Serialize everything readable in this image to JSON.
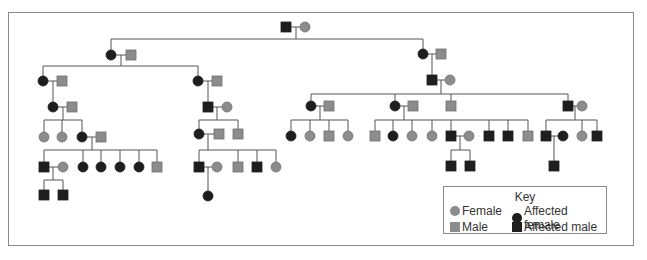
{
  "colors": {
    "unaffected": "#8c8c8c",
    "unaffected_stroke": "#6e6e6e",
    "affected": "#1e1e1e",
    "line": "#555555"
  },
  "key": {
    "title": "Key",
    "items": [
      {
        "label": "Female",
        "shape": "circle",
        "affected": false
      },
      {
        "label": "Affected female",
        "shape": "circle",
        "affected": true
      },
      {
        "label": "Male",
        "shape": "square",
        "affected": false
      },
      {
        "label": "Affected male",
        "shape": "square",
        "affected": true
      }
    ]
  },
  "pedigree": {
    "symbol_size": 10,
    "individuals": [
      {
        "id": "g1m",
        "sex": "M",
        "affected": true,
        "x": 286,
        "y": 27
      },
      {
        "id": "g1f",
        "sex": "F",
        "affected": false,
        "x": 305,
        "y": 27
      },
      {
        "id": "g2Lf",
        "sex": "F",
        "affected": true,
        "x": 111,
        "y": 55
      },
      {
        "id": "g2Lm",
        "sex": "M",
        "affected": false,
        "x": 131,
        "y": 55
      },
      {
        "id": "g2Rf",
        "sex": "F",
        "affected": true,
        "x": 423,
        "y": 54
      },
      {
        "id": "g2Rm",
        "sex": "M",
        "affected": false,
        "x": 441,
        "y": 54
      },
      {
        "id": "g3aF",
        "sex": "F",
        "affected": true,
        "x": 43,
        "y": 81
      },
      {
        "id": "g3aM",
        "sex": "M",
        "affected": false,
        "x": 62,
        "y": 81
      },
      {
        "id": "g3bF",
        "sex": "F",
        "affected": true,
        "x": 198,
        "y": 81
      },
      {
        "id": "g3bM",
        "sex": "M",
        "affected": false,
        "x": 217,
        "y": 81
      },
      {
        "id": "g3cM",
        "sex": "M",
        "affected": true,
        "x": 432,
        "y": 80
      },
      {
        "id": "g3cF",
        "sex": "F",
        "affected": false,
        "x": 450,
        "y": 80
      },
      {
        "id": "g4aF",
        "sex": "F",
        "affected": true,
        "x": 53,
        "y": 107
      },
      {
        "id": "g4aM",
        "sex": "M",
        "affected": false,
        "x": 72,
        "y": 107
      },
      {
        "id": "g4bM",
        "sex": "M",
        "affected": true,
        "x": 208,
        "y": 107
      },
      {
        "id": "g4bF",
        "sex": "F",
        "affected": false,
        "x": 227,
        "y": 107
      },
      {
        "id": "g4cF",
        "sex": "F",
        "affected": true,
        "x": 311,
        "y": 106
      },
      {
        "id": "g4cM",
        "sex": "M",
        "affected": false,
        "x": 329,
        "y": 106
      },
      {
        "id": "g4dF",
        "sex": "F",
        "affected": true,
        "x": 395,
        "y": 106
      },
      {
        "id": "g4dM",
        "sex": "M",
        "affected": false,
        "x": 413,
        "y": 106
      },
      {
        "id": "g4eM",
        "sex": "M",
        "affected": false,
        "x": 451,
        "y": 106
      },
      {
        "id": "g4fM",
        "sex": "M",
        "affected": true,
        "x": 568,
        "y": 106
      },
      {
        "id": "g4fF",
        "sex": "F",
        "affected": false,
        "x": 582,
        "y": 106
      },
      {
        "id": "g5a1",
        "sex": "F",
        "affected": false,
        "x": 44,
        "y": 137
      },
      {
        "id": "g5a2",
        "sex": "F",
        "affected": false,
        "x": 62,
        "y": 137
      },
      {
        "id": "g5a3",
        "sex": "F",
        "affected": true,
        "x": 82,
        "y": 137
      },
      {
        "id": "g5a3m",
        "sex": "M",
        "affected": false,
        "x": 101,
        "y": 137
      },
      {
        "id": "g5b1",
        "sex": "F",
        "affected": true,
        "x": 199,
        "y": 134
      },
      {
        "id": "g5b1m",
        "sex": "M",
        "affected": false,
        "x": 219,
        "y": 134
      },
      {
        "id": "g5b2",
        "sex": "M",
        "affected": false,
        "x": 238,
        "y": 134
      },
      {
        "id": "g5c1",
        "sex": "F",
        "affected": true,
        "x": 291,
        "y": 136
      },
      {
        "id": "g5c2",
        "sex": "F",
        "affected": false,
        "x": 310,
        "y": 136
      },
      {
        "id": "g5c3",
        "sex": "M",
        "affected": false,
        "x": 329,
        "y": 136
      },
      {
        "id": "g5c4",
        "sex": "F",
        "affected": false,
        "x": 348,
        "y": 136
      },
      {
        "id": "g5d1",
        "sex": "M",
        "affected": false,
        "x": 375,
        "y": 136
      },
      {
        "id": "g5d2",
        "sex": "F",
        "affected": true,
        "x": 393,
        "y": 136
      },
      {
        "id": "g5d3",
        "sex": "F",
        "affected": false,
        "x": 412,
        "y": 136
      },
      {
        "id": "g5d4",
        "sex": "F",
        "affected": false,
        "x": 432,
        "y": 136
      },
      {
        "id": "g5d5",
        "sex": "M",
        "affected": true,
        "x": 451,
        "y": 136
      },
      {
        "id": "g5d5f",
        "sex": "F",
        "affected": false,
        "x": 469,
        "y": 136
      },
      {
        "id": "g5d6",
        "sex": "M",
        "affected": true,
        "x": 489,
        "y": 136
      },
      {
        "id": "g5d7",
        "sex": "M",
        "affected": true,
        "x": 508,
        "y": 136
      },
      {
        "id": "g5d8",
        "sex": "M",
        "affected": false,
        "x": 528,
        "y": 136
      },
      {
        "id": "g5e1",
        "sex": "M",
        "affected": true,
        "x": 546,
        "y": 136
      },
      {
        "id": "g5e1f",
        "sex": "F",
        "affected": true,
        "x": 563,
        "y": 136
      },
      {
        "id": "g5e2",
        "sex": "F",
        "affected": false,
        "x": 582,
        "y": 136
      },
      {
        "id": "g5e3",
        "sex": "M",
        "affected": true,
        "x": 597,
        "y": 136
      },
      {
        "id": "g6a1",
        "sex": "M",
        "affected": true,
        "x": 44,
        "y": 167
      },
      {
        "id": "g6a1f",
        "sex": "F",
        "affected": false,
        "x": 63,
        "y": 167
      },
      {
        "id": "g6a2",
        "sex": "F",
        "affected": true,
        "x": 83,
        "y": 167
      },
      {
        "id": "g6a3",
        "sex": "F",
        "affected": true,
        "x": 101,
        "y": 167
      },
      {
        "id": "g6a4",
        "sex": "F",
        "affected": true,
        "x": 120,
        "y": 167
      },
      {
        "id": "g6a5",
        "sex": "F",
        "affected": true,
        "x": 139,
        "y": 167
      },
      {
        "id": "g6a6",
        "sex": "M",
        "affected": false,
        "x": 157,
        "y": 167
      },
      {
        "id": "g6b1",
        "sex": "M",
        "affected": true,
        "x": 199,
        "y": 167
      },
      {
        "id": "g6b1f",
        "sex": "F",
        "affected": false,
        "x": 217,
        "y": 167
      },
      {
        "id": "g6b2",
        "sex": "M",
        "affected": false,
        "x": 238,
        "y": 167
      },
      {
        "id": "g6b3",
        "sex": "M",
        "affected": true,
        "x": 257,
        "y": 167
      },
      {
        "id": "g6b4",
        "sex": "F",
        "affected": false,
        "x": 276,
        "y": 167
      },
      {
        "id": "g6d1",
        "sex": "M",
        "affected": true,
        "x": 451,
        "y": 166
      },
      {
        "id": "g6d2",
        "sex": "M",
        "affected": true,
        "x": 470,
        "y": 166
      },
      {
        "id": "g6e1",
        "sex": "M",
        "affected": true,
        "x": 554,
        "y": 166
      },
      {
        "id": "g7a1",
        "sex": "M",
        "affected": true,
        "x": 44,
        "y": 195
      },
      {
        "id": "g7a2",
        "sex": "M",
        "affected": true,
        "x": 63,
        "y": 195
      },
      {
        "id": "g7b1",
        "sex": "F",
        "affected": true,
        "x": 208,
        "y": 196
      }
    ],
    "lines": [
      [
        291,
        27,
        300,
        27
      ],
      [
        296,
        27,
        296,
        39
      ],
      [
        111,
        39,
        423,
        39
      ],
      [
        111,
        39,
        111,
        50
      ],
      [
        423,
        39,
        423,
        49
      ],
      [
        116,
        55,
        126,
        55
      ],
      [
        121,
        55,
        121,
        66
      ],
      [
        43,
        66,
        198,
        66
      ],
      [
        43,
        66,
        43,
        76
      ],
      [
        198,
        66,
        198,
        76
      ],
      [
        428,
        54,
        436,
        54
      ],
      [
        432,
        54,
        432,
        75
      ],
      [
        48,
        81,
        57,
        81
      ],
      [
        53,
        81,
        53,
        102
      ],
      [
        203,
        81,
        212,
        81
      ],
      [
        208,
        81,
        208,
        102
      ],
      [
        437,
        80,
        445,
        80
      ],
      [
        441,
        80,
        441,
        94
      ],
      [
        311,
        94,
        568,
        94
      ],
      [
        311,
        94,
        311,
        101
      ],
      [
        395,
        94,
        395,
        101
      ],
      [
        451,
        94,
        451,
        101
      ],
      [
        568,
        94,
        568,
        101
      ],
      [
        58,
        107,
        67,
        107
      ],
      [
        63,
        107,
        63,
        120
      ],
      [
        44,
        120,
        82,
        120
      ],
      [
        44,
        120,
        44,
        132
      ],
      [
        62,
        120,
        62,
        132
      ],
      [
        82,
        120,
        82,
        132
      ],
      [
        213,
        107,
        222,
        107
      ],
      [
        217,
        107,
        217,
        120
      ],
      [
        199,
        120,
        238,
        120
      ],
      [
        199,
        120,
        199,
        129
      ],
      [
        238,
        120,
        238,
        129
      ],
      [
        316,
        106,
        324,
        106
      ],
      [
        320,
        106,
        320,
        120
      ],
      [
        291,
        120,
        348,
        120
      ],
      [
        291,
        120,
        291,
        131
      ],
      [
        310,
        120,
        310,
        131
      ],
      [
        329,
        120,
        329,
        131
      ],
      [
        348,
        120,
        348,
        131
      ],
      [
        400,
        106,
        408,
        106
      ],
      [
        404,
        106,
        404,
        120
      ],
      [
        375,
        120,
        528,
        120
      ],
      [
        375,
        120,
        375,
        131
      ],
      [
        393,
        120,
        393,
        131
      ],
      [
        412,
        120,
        412,
        131
      ],
      [
        432,
        120,
        432,
        131
      ],
      [
        451,
        120,
        451,
        131
      ],
      [
        489,
        120,
        489,
        131
      ],
      [
        508,
        120,
        508,
        131
      ],
      [
        528,
        120,
        528,
        131
      ],
      [
        573,
        106,
        577,
        106
      ],
      [
        575,
        106,
        575,
        120
      ],
      [
        546,
        120,
        597,
        120
      ],
      [
        546,
        120,
        546,
        131
      ],
      [
        582,
        120,
        582,
        131
      ],
      [
        597,
        120,
        597,
        131
      ],
      [
        87,
        137,
        96,
        137
      ],
      [
        92,
        137,
        92,
        150
      ],
      [
        44,
        150,
        157,
        150
      ],
      [
        44,
        150,
        44,
        162
      ],
      [
        83,
        150,
        83,
        162
      ],
      [
        101,
        150,
        101,
        162
      ],
      [
        120,
        150,
        120,
        162
      ],
      [
        139,
        150,
        139,
        162
      ],
      [
        157,
        150,
        157,
        162
      ],
      [
        204,
        134,
        214,
        134
      ],
      [
        208,
        134,
        208,
        150
      ],
      [
        199,
        150,
        276,
        150
      ],
      [
        199,
        150,
        199,
        162
      ],
      [
        238,
        150,
        238,
        162
      ],
      [
        257,
        150,
        257,
        162
      ],
      [
        276,
        150,
        276,
        162
      ],
      [
        456,
        136,
        464,
        136
      ],
      [
        460,
        136,
        460,
        150
      ],
      [
        451,
        150,
        470,
        150
      ],
      [
        451,
        150,
        451,
        161
      ],
      [
        470,
        150,
        470,
        161
      ],
      [
        551,
        136,
        558,
        136
      ],
      [
        554,
        136,
        554,
        161
      ],
      [
        49,
        167,
        58,
        167
      ],
      [
        53,
        167,
        53,
        180
      ],
      [
        44,
        180,
        63,
        180
      ],
      [
        44,
        180,
        44,
        190
      ],
      [
        63,
        180,
        63,
        190
      ],
      [
        204,
        167,
        212,
        167
      ],
      [
        208,
        167,
        208,
        191
      ]
    ]
  }
}
